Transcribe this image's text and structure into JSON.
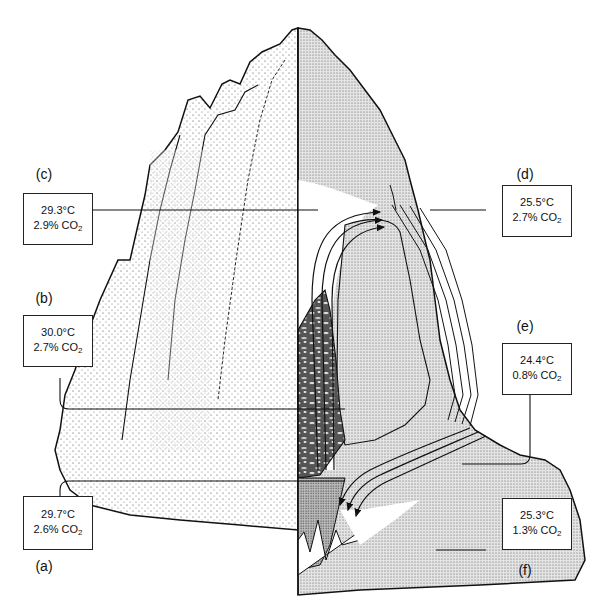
{
  "figure": {
    "colors": {
      "ink": "#111111",
      "paper": "#ffffff",
      "stipple_light": "#d9d9d9",
      "stipple_dark": "#b3b3b3"
    }
  },
  "measurements": [
    {
      "id": "a",
      "letter": "(a)",
      "temp": "29.7°C",
      "co2_value": "2.6% CO",
      "co2_sub": "2"
    },
    {
      "id": "b",
      "letter": "(b)",
      "temp": "30.0°C",
      "co2_value": "2.7% CO",
      "co2_sub": "2"
    },
    {
      "id": "c",
      "letter": "(c)",
      "temp": "29.3°C",
      "co2_value": "2.9% CO",
      "co2_sub": "2"
    },
    {
      "id": "d",
      "letter": "(d)",
      "temp": "25.5°C",
      "co2_value": "2.7% CO",
      "co2_sub": "2"
    },
    {
      "id": "e",
      "letter": "(e)",
      "temp": "24.4°C",
      "co2_value": "0.8% CO",
      "co2_sub": "2"
    },
    {
      "id": "f",
      "letter": "(f)",
      "temp": "25.3°C",
      "co2_value": "1.3% CO",
      "co2_sub": "2"
    }
  ]
}
